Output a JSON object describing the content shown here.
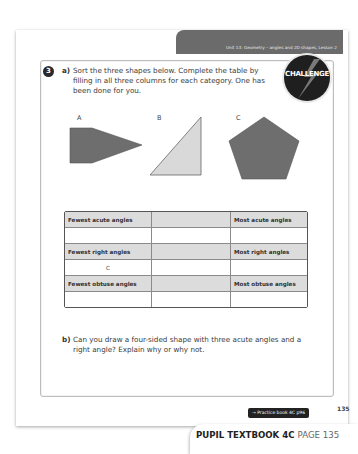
{
  "header": {
    "unit_title": "Unit 13: Geometry – angles and 2D shapes, Lesson 2",
    "band_color": "#6b6b6b"
  },
  "question": {
    "number": "3",
    "badge": "CHALLENGE",
    "part_a": {
      "label": "a)",
      "text": "Sort the three shapes below. Complete the table by filling in all three columns for each category. One has been done for you."
    },
    "shapes": [
      {
        "label": "A",
        "type": "pentagon-arrow",
        "color": "#6e6e6e"
      },
      {
        "label": "B",
        "type": "right-triangle",
        "color": "#d9d9d9"
      },
      {
        "label": "C",
        "type": "regular-pentagon",
        "color": "#6e6e6e"
      }
    ],
    "table": {
      "rows": [
        {
          "type": "header",
          "cells": [
            "Fewest acute angles",
            "",
            "Most acute angles"
          ]
        },
        {
          "type": "answer",
          "cells": [
            "",
            "",
            ""
          ]
        },
        {
          "type": "header",
          "cells": [
            "Fewest right angles",
            "",
            "Most right angles"
          ]
        },
        {
          "type": "answer",
          "cells": [
            "C",
            "",
            ""
          ]
        },
        {
          "type": "header",
          "cells": [
            "Fewest obtuse angles",
            "",
            "Most obtuse angles"
          ]
        },
        {
          "type": "answer",
          "cells": [
            "",
            "",
            ""
          ]
        }
      ]
    },
    "part_b": {
      "label": "b)",
      "text": "Can you draw a four-sided shape with three acute angles and a right angle? Explain why or why not."
    }
  },
  "footer": {
    "practice_ref": "→ Practice book 4C p96",
    "page_number": "135",
    "book_title": "PUPIL TEXTBOOK 4C",
    "book_page": "PAGE 135"
  }
}
